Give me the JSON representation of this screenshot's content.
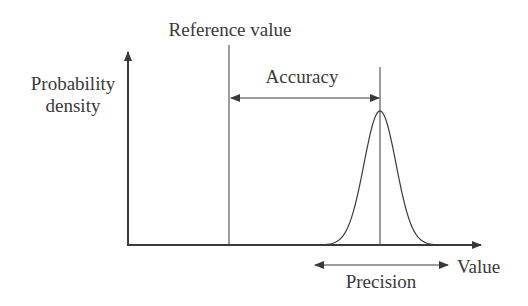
{
  "diagram": {
    "labels": {
      "y_axis_line1": "Probability",
      "y_axis_line2": "density",
      "x_axis": "Value",
      "reference": "Reference value",
      "accuracy": "Accuracy",
      "precision": "Precision"
    },
    "colors": {
      "stroke": "#3a3a3a",
      "text": "#3a3a3a",
      "background": "#ffffff"
    },
    "geometry": {
      "origin": [
        128,
        245
      ],
      "x_axis_end": 481,
      "y_axis_top": 52,
      "reference_x": 229,
      "peak_x": 380,
      "peak_y": 111,
      "sigma_px": 16,
      "accuracy_arrow_y": 98,
      "precision_arrow": {
        "x1": 315,
        "x2": 448,
        "y": 265
      }
    }
  }
}
